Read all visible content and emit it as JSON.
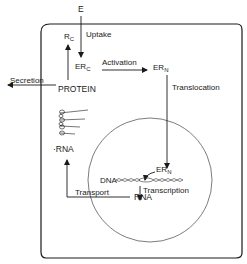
{
  "diagram": {
    "nodes": {
      "E": "E",
      "Rc_main": "R",
      "Rc_sub": "C",
      "ERc_main": "ER",
      "ERc_sub": "C",
      "ERn_main": "ER",
      "ERn_sub": "N",
      "ERn2_main": "ER",
      "ERn2_sub": "N",
      "protein": "PROTEIN",
      "rna_cyto": "·RNA",
      "rna_nuc": "RNA",
      "dna": "DNA"
    },
    "edges": {
      "uptake": "Uptake",
      "activation": "Activation",
      "translocation": "Translocation",
      "secretion": "Secretion",
      "transcription": "Transcription",
      "transport": "Transport"
    },
    "compartments": [
      "cell",
      "nucleus"
    ],
    "colors": {
      "line": "#1a1a1a",
      "background": "#ffffff"
    }
  }
}
